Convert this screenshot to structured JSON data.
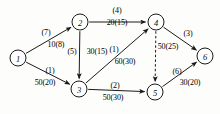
{
  "diagram": {
    "type": "directed-network",
    "colors": {
      "stroke": "#1a1a1a",
      "node_fill": "#ffffff",
      "background": "#fdfdfb",
      "text": "#121212"
    },
    "nodes": [
      {
        "id": "1",
        "label": "1",
        "x": 18,
        "y": 58,
        "r": 8
      },
      {
        "id": "2",
        "label": "2",
        "x": 80,
        "y": 22,
        "r": 8
      },
      {
        "id": "3",
        "label": "3",
        "x": 79,
        "y": 89,
        "r": 8
      },
      {
        "id": "4",
        "label": "4",
        "x": 156,
        "y": 22,
        "r": 8
      },
      {
        "id": "5",
        "label": "5",
        "x": 155,
        "y": 92,
        "r": 8
      },
      {
        "id": "6",
        "label": "6",
        "x": 205,
        "y": 56,
        "r": 8
      }
    ],
    "edges": [
      {
        "id": "e12",
        "from": "1",
        "to": "2",
        "style": "solid",
        "arrow": true,
        "cost_label": "(7)",
        "cost_x": 46,
        "cost_y": 33,
        "flow_label": "10(8)",
        "flow_x": 56,
        "flow_y": 45
      },
      {
        "id": "e13",
        "from": "1",
        "to": "3",
        "style": "solid",
        "arrow": true,
        "cost_label": "(1)",
        "cost_x": 50,
        "cost_y": 71,
        "flow_label": "50(20)",
        "flow_x": 45,
        "flow_y": 83
      },
      {
        "id": "e23",
        "from": "2",
        "to": "3",
        "style": "solid",
        "arrow": true,
        "cost_label": "(5)",
        "cost_x": 72,
        "cost_y": 52,
        "flow_label": "30(15)",
        "flow_x": 97,
        "flow_y": 52
      },
      {
        "id": "e24",
        "from": "2",
        "to": "4",
        "style": "solid",
        "arrow": true,
        "cost_label": "(4)",
        "cost_x": 117,
        "cost_y": 11,
        "flow_label": "20(15)",
        "flow_x": 117,
        "flow_y": 23
      },
      {
        "id": "e34",
        "from": "3",
        "to": "4",
        "style": "solid",
        "arrow": true,
        "cost_label": "(1)",
        "cost_x": 114,
        "cost_y": 50,
        "flow_label": "60(30)",
        "flow_x": 125,
        "flow_y": 62
      },
      {
        "id": "e35",
        "from": "3",
        "to": "5",
        "style": "solid",
        "arrow": true,
        "cost_label": "(2)",
        "cost_x": 115,
        "cost_y": 86,
        "flow_label": "50(30)",
        "flow_x": 113,
        "flow_y": 98
      },
      {
        "id": "e45",
        "from": "4",
        "to": "5",
        "style": "dashed",
        "arrow": true,
        "cost_label": "",
        "cost_x": 0,
        "cost_y": 0,
        "flow_label": "50(25)",
        "flow_x": 168,
        "flow_y": 47
      },
      {
        "id": "e46",
        "from": "4",
        "to": "6",
        "style": "solid",
        "arrow": true,
        "cost_label": "(3)",
        "cost_x": 188,
        "cost_y": 34,
        "flow_label": "",
        "flow_x": 0,
        "flow_y": 0
      },
      {
        "id": "e56",
        "from": "5",
        "to": "6",
        "style": "solid",
        "arrow": true,
        "cost_label": "(6)",
        "cost_x": 177,
        "cost_y": 72,
        "flow_label": "30(20)",
        "flow_x": 190,
        "flow_y": 83
      }
    ]
  }
}
